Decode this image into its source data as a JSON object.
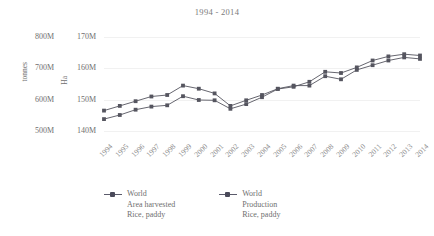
{
  "chart_data": {
    "type": "line",
    "title": "1994 - 2014",
    "xlabel": "",
    "ylabel": "tonnes",
    "y2label": "Ha",
    "grid": true,
    "legend_position": "bottom",
    "categories": [
      "1994",
      "1995",
      "1996",
      "1997",
      "1998",
      "1999",
      "2000",
      "2001",
      "2002",
      "2003",
      "2004",
      "2005",
      "2006",
      "2007",
      "2008",
      "2009",
      "2010",
      "2011",
      "2012",
      "2013",
      "2014"
    ],
    "axes": {
      "left": {
        "name": "tonnes",
        "ticks": [
          "500M",
          "600M",
          "700M",
          "800M"
        ],
        "tick_values": [
          500000000,
          600000000,
          700000000,
          800000000
        ],
        "ylim": [
          480000000,
          830000000
        ]
      },
      "right": {
        "name": "Ha",
        "ticks": [
          "140M",
          "150M",
          "160M",
          "170M"
        ],
        "tick_values": [
          140000000,
          150000000,
          160000000,
          170000000
        ],
        "ylim": [
          136000000,
          171000000
        ]
      }
    },
    "series": [
      {
        "name": "World Area harvested Rice, paddy",
        "legend_line1": "World",
        "legend_line2": "Area harvested",
        "legend_line3": "Rice, paddy",
        "axis": "right",
        "unit": "Ha",
        "color": "#55555f",
        "values": [
          146.5,
          148.0,
          149.5,
          151.0,
          151.5,
          154.5,
          153.5,
          152.0,
          148.0,
          149.8,
          151.5,
          153.5,
          154.5,
          154.5,
          157.5,
          156.5,
          159.5,
          161.0,
          162.5,
          163.5,
          163.0
        ]
      },
      {
        "name": "World Production Rice, paddy",
        "legend_line1": "World",
        "legend_line2": "Production",
        "legend_line3": "Rice, paddy",
        "axis": "left",
        "unit": "tonnes",
        "color": "#55555f",
        "values": [
          538,
          551,
          568,
          578,
          582,
          611,
          599,
          598,
          571,
          586,
          608,
          634,
          641,
          657,
          689,
          685,
          703,
          725,
          738,
          745,
          741
        ]
      }
    ]
  },
  "legend": [
    {
      "line1": "World",
      "line2": "Area harvested",
      "line3": "Rice, paddy"
    },
    {
      "line1": "World",
      "line2": "Production",
      "line3": "Rice, paddy"
    }
  ]
}
